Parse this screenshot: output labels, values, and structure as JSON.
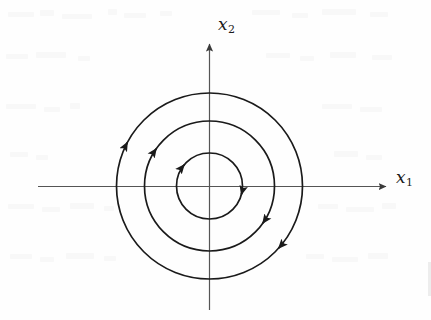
{
  "figure": {
    "kind": "phase-portrait",
    "background_color": "#fefefe",
    "stroke_color": "#1a1a1a",
    "axis_color": "#555555",
    "axes": {
      "x_label": "x",
      "x_subscript": "1",
      "y_label": "x",
      "y_subscript": "2",
      "x_axis_start_px": 38,
      "x_axis_end_px": 392,
      "y_axis_top_px": 38,
      "y_axis_bottom_px": 310,
      "origin_x_px": 209,
      "origin_y_px": 186,
      "x_arrowhead": "right",
      "y_arrowhead": "up"
    }
  },
  "chart_data": {
    "type": "line",
    "title": "",
    "xlabel": "x1",
    "ylabel": "x2",
    "grid": false,
    "legend": null,
    "orbit_direction": "clockwise",
    "equilibrium": "center",
    "center_point": [
      0,
      0
    ],
    "orbits": [
      {
        "name": "inner-orbit",
        "radius_px": 33,
        "arrows": [
          {
            "angle_deg": 140,
            "direction": "clockwise"
          },
          {
            "angle_deg": 345,
            "direction": "clockwise"
          }
        ]
      },
      {
        "name": "middle-orbit",
        "radius_px": 65,
        "arrows": [
          {
            "angle_deg": 145,
            "direction": "clockwise"
          },
          {
            "angle_deg": 325,
            "direction": "clockwise"
          }
        ]
      },
      {
        "name": "outer-orbit",
        "radius_px": 93,
        "arrows": [
          {
            "angle_deg": 152,
            "direction": "clockwise"
          },
          {
            "angle_deg": 318,
            "direction": "clockwise"
          }
        ]
      }
    ]
  }
}
